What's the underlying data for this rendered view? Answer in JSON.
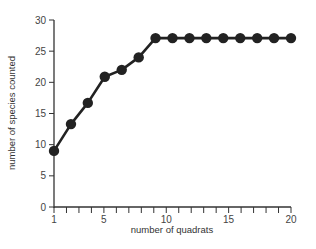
{
  "chart_data": {
    "type": "line",
    "title": "",
    "xlabel": "number of quadrats",
    "ylabel": "number of species counted",
    "xlim": [
      1,
      20
    ],
    "ylim": [
      0,
      30
    ],
    "x_ticks": [
      1,
      5,
      10,
      15,
      20
    ],
    "y_ticks": [
      0,
      5,
      10,
      15,
      20,
      25,
      30
    ],
    "grid": false,
    "legend": null,
    "series": [
      {
        "name": "species counted",
        "color": "#222222",
        "marker": "circle",
        "x": [
          1,
          2.36,
          3.71,
          5.07,
          6.43,
          7.79,
          9.14,
          10.5,
          11.86,
          13.21,
          14.57,
          15.93,
          17.29,
          18.64,
          20
        ],
        "y": [
          9,
          13.3,
          16.7,
          20.9,
          22,
          24,
          27.1,
          27.1,
          27.1,
          27.1,
          27.1,
          27.1,
          27.1,
          27.1,
          27.1
        ]
      }
    ]
  }
}
